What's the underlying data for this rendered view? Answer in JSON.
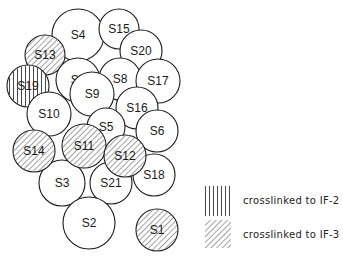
{
  "diagram": {
    "type": "subunit-topography",
    "stroke_color": "#1a1a1a",
    "fill_color": "#ffffff",
    "circles": [
      {
        "id": "S4",
        "label": "S4",
        "cx": 78,
        "cy": 35,
        "r": 26,
        "pattern": "none"
      },
      {
        "id": "S15",
        "label": "S15",
        "cx": 119,
        "cy": 29,
        "r": 20,
        "pattern": "none"
      },
      {
        "id": "S20",
        "label": "S20",
        "cx": 141,
        "cy": 51,
        "r": 21,
        "pattern": "none"
      },
      {
        "id": "S13",
        "label": "S13",
        "cx": 45,
        "cy": 55,
        "r": 20,
        "pattern": "IF-3"
      },
      {
        "id": "S7",
        "label": "S7",
        "cx": 78,
        "cy": 80,
        "r": 22,
        "pattern": "none"
      },
      {
        "id": "S8",
        "label": "S8",
        "cx": 120,
        "cy": 79,
        "r": 21,
        "pattern": "none"
      },
      {
        "id": "S17",
        "label": "S17",
        "cx": 158,
        "cy": 81,
        "r": 22,
        "pattern": "none"
      },
      {
        "id": "S19",
        "label": "S19",
        "cx": 28,
        "cy": 86,
        "r": 21,
        "pattern": "IF-2"
      },
      {
        "id": "S10",
        "label": "S10",
        "cx": 49,
        "cy": 114,
        "r": 22,
        "pattern": "none"
      },
      {
        "id": "S9",
        "label": "S9",
        "cx": 92,
        "cy": 94,
        "r": 22,
        "pattern": "none"
      },
      {
        "id": "S16",
        "label": "S16",
        "cx": 137,
        "cy": 108,
        "r": 21,
        "pattern": "none"
      },
      {
        "id": "S5",
        "label": "S5",
        "cx": 106,
        "cy": 127,
        "r": 19,
        "pattern": "none"
      },
      {
        "id": "S6",
        "label": "S6",
        "cx": 157,
        "cy": 131,
        "r": 21,
        "pattern": "none"
      },
      {
        "id": "S3",
        "label": "S3",
        "cx": 62,
        "cy": 183,
        "r": 23,
        "pattern": "none"
      },
      {
        "id": "S21",
        "label": "S21",
        "cx": 111,
        "cy": 183,
        "r": 21,
        "pattern": "none"
      },
      {
        "id": "S18",
        "label": "S18",
        "cx": 154,
        "cy": 175,
        "r": 21,
        "pattern": "none"
      },
      {
        "id": "S14",
        "label": "S14",
        "cx": 34,
        "cy": 151,
        "r": 21,
        "pattern": "IF-3"
      },
      {
        "id": "S11",
        "label": "S11",
        "cx": 84,
        "cy": 146,
        "r": 22,
        "pattern": "IF-3"
      },
      {
        "id": "S12",
        "label": "S12",
        "cx": 125,
        "cy": 156,
        "r": 21,
        "pattern": "IF-3"
      },
      {
        "id": "S2",
        "label": "S2",
        "cx": 89,
        "cy": 223,
        "r": 26,
        "pattern": "none"
      },
      {
        "id": "S1",
        "label": "S1",
        "cx": 157,
        "cy": 230,
        "r": 21,
        "pattern": "IF-3"
      }
    ]
  },
  "legend": {
    "items": [
      {
        "pattern": "vertical-lines",
        "label": "crosslinked to IF-2"
      },
      {
        "pattern": "diagonal-hatch",
        "label": "crosslinked to IF-3"
      }
    ]
  }
}
